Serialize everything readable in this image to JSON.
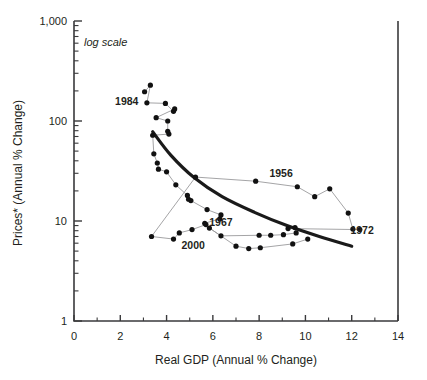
{
  "chart_data": {
    "type": "scatter",
    "title": "",
    "subtitle": "",
    "note": "log scale",
    "xlabel": "Real GDP (Annual % Change)",
    "ylabel": "Prices* (Annual % Change)",
    "xlim": [
      0,
      14
    ],
    "ylim": [
      1,
      1000
    ],
    "yscale": "log",
    "xscale": "linear",
    "grid": false,
    "legend": false,
    "x_ticks": [
      0,
      2,
      4,
      6,
      8,
      10,
      12,
      14
    ],
    "x_tick_labels": [
      "0",
      "2",
      "4",
      "6",
      "8",
      "10",
      "12",
      "14"
    ],
    "x_minor_ticks": [
      1,
      3,
      5,
      7,
      9,
      11,
      13
    ],
    "y_ticks": [
      1,
      10,
      100,
      1000
    ],
    "y_tick_labels": [
      "1",
      "10",
      "100",
      "1,000"
    ],
    "annotations": [
      {
        "label": "1984",
        "x": 2.28,
        "y": 155
      },
      {
        "label": "1956",
        "x": 8.95,
        "y": 30
      },
      {
        "label": "1967",
        "x": 6.35,
        "y": 9.6
      },
      {
        "label": "1972",
        "x": 12.45,
        "y": 8.0
      },
      {
        "label": "2000",
        "x": 5.15,
        "y": 5.7
      }
    ],
    "series": [
      {
        "name": "connected-path",
        "marker": "filled-circle",
        "points": [
          {
            "x": 3.05,
            "y": 196
          },
          {
            "x": 3.3,
            "y": 228
          },
          {
            "x": 3.15,
            "y": 152
          },
          {
            "x": 3.95,
            "y": 150
          },
          {
            "x": 4.3,
            "y": 125
          },
          {
            "x": 4.35,
            "y": 132
          },
          {
            "x": 3.55,
            "y": 108
          },
          {
            "x": 4.05,
            "y": 100
          },
          {
            "x": 4.05,
            "y": 79
          },
          {
            "x": 4.1,
            "y": 74
          },
          {
            "x": 3.4,
            "y": 72
          },
          {
            "x": 3.45,
            "y": 47
          },
          {
            "x": 3.6,
            "y": 38
          },
          {
            "x": 3.65,
            "y": 33
          },
          {
            "x": 4.0,
            "y": 31
          },
          {
            "x": 4.4,
            "y": 23
          },
          {
            "x": 4.9,
            "y": 18
          },
          {
            "x": 4.95,
            "y": 16.5
          },
          {
            "x": 5.05,
            "y": 16.0
          },
          {
            "x": 5.75,
            "y": 13.0
          },
          {
            "x": 6.35,
            "y": 11.5
          },
          {
            "x": 6.3,
            "y": 10.5
          },
          {
            "x": 5.65,
            "y": 9.5
          },
          {
            "x": 5.7,
            "y": 9.2
          },
          {
            "x": 5.1,
            "y": 8.2
          },
          {
            "x": 4.55,
            "y": 7.6
          },
          {
            "x": 4.3,
            "y": 6.6
          },
          {
            "x": 3.35,
            "y": 7.0
          },
          {
            "x": 5.25,
            "y": 27.5
          },
          {
            "x": 7.85,
            "y": 25.0
          },
          {
            "x": 9.65,
            "y": 22.0
          },
          {
            "x": 10.4,
            "y": 17.5
          },
          {
            "x": 11.05,
            "y": 21.0
          },
          {
            "x": 11.85,
            "y": 12.0
          },
          {
            "x": 12.05,
            "y": 8.3
          },
          {
            "x": 12.35,
            "y": 8.2
          },
          {
            "x": 9.25,
            "y": 8.4
          },
          {
            "x": 9.55,
            "y": 8.6
          },
          {
            "x": 9.6,
            "y": 7.6
          },
          {
            "x": 9.05,
            "y": 7.3
          },
          {
            "x": 8.5,
            "y": 7.2
          },
          {
            "x": 8.0,
            "y": 7.2
          },
          {
            "x": 6.35,
            "y": 7.1
          },
          {
            "x": 5.85,
            "y": 8.5
          },
          {
            "x": 7.0,
            "y": 5.6
          },
          {
            "x": 7.55,
            "y": 5.3
          },
          {
            "x": 8.05,
            "y": 5.4
          },
          {
            "x": 9.45,
            "y": 5.9
          },
          {
            "x": 10.1,
            "y": 6.6
          }
        ]
      }
    ],
    "trend_curve": {
      "name": "fitted-trend",
      "points": [
        {
          "x": 3.4,
          "y": 78
        },
        {
          "x": 4.2,
          "y": 45
        },
        {
          "x": 5.2,
          "y": 27
        },
        {
          "x": 6.4,
          "y": 17.5
        },
        {
          "x": 7.8,
          "y": 12.2
        },
        {
          "x": 9.2,
          "y": 9.0
        },
        {
          "x": 10.6,
          "y": 7.0
        },
        {
          "x": 12.0,
          "y": 5.6
        }
      ]
    }
  }
}
